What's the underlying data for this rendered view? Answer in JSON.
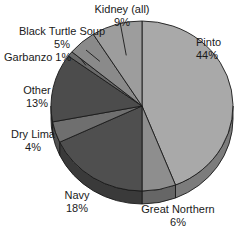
{
  "chart_data": {
    "type": "pie",
    "title": "",
    "subtitle": "",
    "xlabel": "",
    "ylabel": "",
    "legend_position": "none",
    "grid": false,
    "value_unit": "percent",
    "three_d": true,
    "categories": [
      "Pinto",
      "Great Northern",
      "Navy",
      "Dry Lima",
      "Other",
      "Garbanzo",
      "Black Turtle Soup",
      "Kidney (all)"
    ],
    "values": [
      44,
      6,
      18,
      4,
      13,
      1,
      5,
      9
    ],
    "slices": [
      {
        "label": "Pinto",
        "pct": 44,
        "pct_text": "44%",
        "color": "#a9a9a9",
        "side_color": "#7c7c7c",
        "start_deg": 0,
        "end_deg": 158.4
      },
      {
        "label": "Great Northern",
        "pct": 6,
        "pct_text": "6%",
        "color": "#8e8e8e",
        "side_color": "#666666",
        "start_deg": 158.4,
        "end_deg": 180.0
      },
      {
        "label": "Navy",
        "pct": 18,
        "pct_text": "18%",
        "color": "#4f4f4f",
        "side_color": "#3a3a3a",
        "start_deg": 180.0,
        "end_deg": 244.8
      },
      {
        "label": "Dry Lima",
        "pct": 4,
        "pct_text": "4%",
        "color": "#6f6f6f",
        "side_color": "#515151",
        "start_deg": 244.8,
        "end_deg": 259.2
      },
      {
        "label": "Other",
        "pct": 13,
        "pct_text": "13%",
        "color": "#4c4c4c",
        "side_color": "#383838",
        "start_deg": 259.2,
        "end_deg": 306.0
      },
      {
        "label": "Garbanzo",
        "pct": 1,
        "pct_text": "1%",
        "color": "#6a6a6a",
        "side_color": "#4d4d4d",
        "start_deg": 306.0,
        "end_deg": 309.6
      },
      {
        "label": "Black Turtle Soup",
        "pct": 5,
        "pct_text": "5%",
        "color": "#8a8a8a",
        "side_color": "#636363",
        "start_deg": 309.6,
        "end_deg": 327.6
      },
      {
        "label": "Kidney (all)",
        "pct": 9,
        "pct_text": "9%",
        "color": "#9d9d9d",
        "side_color": "#727272",
        "start_deg": 327.6,
        "end_deg": 360.0
      }
    ]
  },
  "labels": {
    "kidney": {
      "name": "Kidney (all)",
      "pct": "9%"
    },
    "black_turtle_soup": {
      "name": "Black Turtle Soup",
      "pct": "5%"
    },
    "garbanzo": {
      "name": "Garbanzo 1%",
      "pct": ""
    },
    "other": {
      "name": "Other",
      "pct": "13%"
    },
    "dry_lima": {
      "name": "Dry Lima",
      "pct": "4%"
    },
    "navy": {
      "name": "Navy",
      "pct": "18%"
    },
    "great_northern": {
      "name": "Great Northern",
      "pct": "6%"
    },
    "pinto": {
      "name": "Pinto",
      "pct": "44%"
    }
  },
  "geometry": {
    "cx": 142,
    "cy": 106,
    "rx": 91,
    "ry": 85,
    "depth": 13,
    "outline": "#1a1a1a"
  }
}
